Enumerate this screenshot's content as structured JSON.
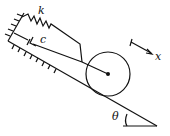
{
  "diagram": {
    "labels": {
      "spring": "k",
      "damper": "c",
      "coordinate": "x",
      "angle": "θ"
    },
    "components": [
      "fixed-wall",
      "spring",
      "damper",
      "rolling-disk",
      "inclined-plane",
      "coordinate-arrow",
      "angle-marker"
    ],
    "stroke_color": "#111111"
  }
}
